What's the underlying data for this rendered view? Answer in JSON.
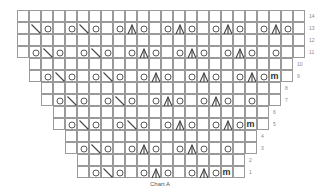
{
  "chart": {
    "title": "Chart A",
    "grid": {
      "origin_x": 17,
      "origin_y": 10,
      "cell_size": 12,
      "total_columns": 24,
      "line_color": "#9a9a9a",
      "symbol_color": "#444444"
    },
    "legend_symbols": {
      ".": "empty-cell",
      "O": "yarn-over-icon",
      "\\": "ssk-decrease-icon",
      "A": "centered-double-decrease-icon",
      "m": "make-one-icon"
    },
    "rows": [
      {
        "label": "14",
        "start_col": 1,
        "cells": "........................"
      },
      {
        "label": "13",
        "start_col": 1,
        "cells": ".\\O.O\\O.OAO.OAO.OAO.OAO."
      },
      {
        "label": "12",
        "start_col": 1,
        "cells": "........................"
      },
      {
        "label": "11",
        "start_col": 1,
        "cells": ".O\\O.O\\O.OAO.OAO.OAO.O.."
      },
      {
        "label": "10",
        "start_col": 2,
        "cells": "......................"
      },
      {
        "label": "9",
        "start_col": 2,
        "cells": ".O\\O.O\\O.OAO.OAO.OAOm."
      },
      {
        "label": "8",
        "start_col": 3,
        "cells": "...................."
      },
      {
        "label": "7",
        "start_col": 3,
        "cells": ".O\\O.O\\O.OAO.OAO.O.."
      },
      {
        "label": "6",
        "start_col": 4,
        "cells": ".................."
      },
      {
        "label": "5",
        "start_col": 4,
        "cells": ".O\\O.O\\O.OAO.OAOm."
      },
      {
        "label": "4",
        "start_col": 5,
        "cells": "................"
      },
      {
        "label": "3",
        "start_col": 5,
        "cells": ".O\\O.OAO.OAO.O.."
      },
      {
        "label": "2",
        "start_col": 6,
        "cells": ".............."
      },
      {
        "label": "1",
        "start_col": 6,
        "cells": ".O\\O.OAO.OAOm."
      }
    ]
  }
}
